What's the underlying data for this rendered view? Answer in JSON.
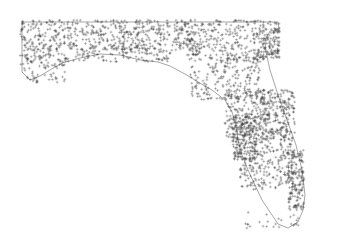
{
  "map": {
    "subject": "Florida point density map",
    "marker_symbol": "+",
    "marker_color": "#333333",
    "outline_color": "#6a6a6a",
    "background": "#ffffff",
    "outline_path": "M22,22 L278,22 L279,30 L270,31 L265,40 L266,52 L270,70 L278,95 L287,120 L296,145 L302,170 L305,195 L303,210 L298,222 L288,228 L278,224 L270,212 L262,200 L255,185 L248,170 L242,155 L238,140 L236,125 L232,112 L225,100 L212,90 L198,82 L185,74 L170,66 L158,62 L140,60 L120,55 L100,54 L80,58 L62,63 L50,70 L40,76 L30,80 L22,72 Z",
    "regions": [
      {
        "name": "panhandle-north",
        "x": 20,
        "y": 20,
        "w": 175,
        "h": 30,
        "count": 520
      },
      {
        "name": "panhandle-coast",
        "x": 22,
        "y": 48,
        "w": 150,
        "h": 14,
        "count": 180
      },
      {
        "name": "panhandle-west-tip",
        "x": 20,
        "y": 55,
        "w": 45,
        "h": 30,
        "count": 70
      },
      {
        "name": "north-central",
        "x": 185,
        "y": 20,
        "w": 95,
        "h": 40,
        "count": 330
      },
      {
        "name": "jacksonville",
        "x": 258,
        "y": 28,
        "w": 22,
        "h": 30,
        "count": 80
      },
      {
        "name": "central-west",
        "x": 190,
        "y": 55,
        "w": 70,
        "h": 45,
        "count": 220
      },
      {
        "name": "central",
        "x": 225,
        "y": 90,
        "w": 65,
        "h": 50,
        "count": 260
      },
      {
        "name": "tampa",
        "x": 232,
        "y": 115,
        "w": 25,
        "h": 45,
        "count": 220
      },
      {
        "name": "orlando-east",
        "x": 260,
        "y": 90,
        "w": 35,
        "h": 60,
        "count": 200
      },
      {
        "name": "south-central",
        "x": 240,
        "y": 150,
        "w": 55,
        "h": 40,
        "count": 190
      },
      {
        "name": "southeast-coast",
        "x": 288,
        "y": 150,
        "w": 16,
        "h": 60,
        "count": 160
      },
      {
        "name": "keys",
        "x": 245,
        "y": 212,
        "w": 55,
        "h": 16,
        "count": 25
      }
    ]
  }
}
